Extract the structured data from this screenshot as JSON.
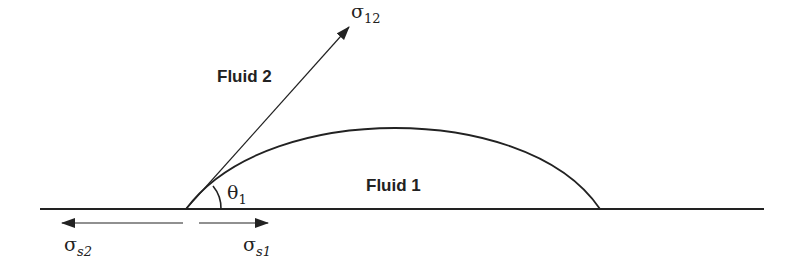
{
  "diagram": {
    "labels": {
      "fluid2": "Fluid 2",
      "fluid1": "Fluid 1"
    },
    "symbols": {
      "sigma12": {
        "base": "σ",
        "sub": "12"
      },
      "theta1": {
        "base": "θ",
        "sub": "1"
      },
      "sigma_s1": {
        "base": "σ",
        "sub": "s1"
      },
      "sigma_s2": {
        "base": "σ",
        "sub": "s2"
      }
    },
    "colors": {
      "stroke": "#222222",
      "background": "#ffffff"
    }
  }
}
